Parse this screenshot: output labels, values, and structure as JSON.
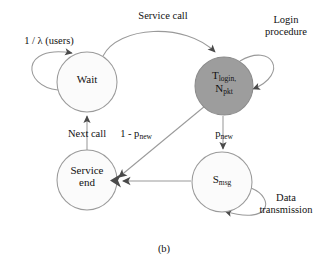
{
  "figure": {
    "caption": "(b)",
    "type": "state-transition-diagram"
  },
  "colors": {
    "stroke": "#8a8a8a",
    "node_fill_light": "#fbfbfb",
    "node_fill_shaded": "#9d9d9d",
    "text": "#111111",
    "arrowhead": "#4a4a4a",
    "background": "#ffffff"
  },
  "nodes": [
    {
      "id": "wait",
      "label_line1": "Wait",
      "label_line2": "",
      "shaded": false,
      "cx": 87,
      "cy": 82,
      "r": 30
    },
    {
      "id": "login",
      "label_line1": "T",
      "label_sub1": "login,",
      "label_line2": "N",
      "label_sub2": "pkt",
      "shaded": true,
      "cx": 224,
      "cy": 86,
      "r": 29
    },
    {
      "id": "service_end",
      "label_line1": "Service",
      "label_line2": "end",
      "shaded": false,
      "cx": 87,
      "cy": 180,
      "r": 30
    },
    {
      "id": "smsg",
      "label_line1": "S",
      "label_sub1": "msg",
      "label_line2": "",
      "shaded": false,
      "cx": 222,
      "cy": 182,
      "r": 30
    }
  ],
  "edge_labels": [
    {
      "id": "arrival-rate",
      "text_line1": "1 / λ (users)",
      "text_line2": ""
    },
    {
      "id": "service-call",
      "text_line1": "Service call",
      "text_line2": ""
    },
    {
      "id": "login-procedure",
      "text_line1": "Login",
      "text_line2": "procedure"
    },
    {
      "id": "next-call",
      "text_line1": "Next call",
      "text_line2": ""
    },
    {
      "id": "one-minus-pnew",
      "text_prefix": "1 - p",
      "text_sub": "new"
    },
    {
      "id": "pnew",
      "text_prefix": "p",
      "text_sub": "new"
    },
    {
      "id": "data-transmission",
      "text_line1": "Data",
      "text_line2": "transmission"
    }
  ]
}
